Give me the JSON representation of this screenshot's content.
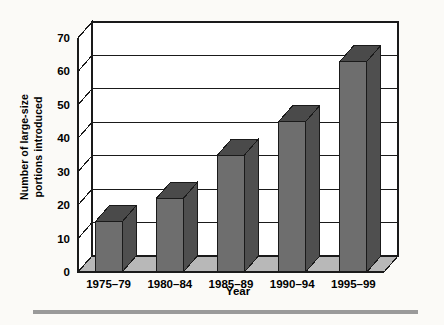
{
  "chart_data": {
    "type": "bar",
    "title": "",
    "xlabel": "Year",
    "ylabel_line1": "Number of large-size",
    "ylabel_line2": "portions introduced",
    "ylabel": "Number of large-size portions introduced",
    "categories": [
      "1975–79",
      "1980–84",
      "1985–89",
      "1990–94",
      "1995–99"
    ],
    "values": [
      15,
      22,
      35,
      45,
      63
    ],
    "ylim": [
      0,
      70
    ],
    "yticks": [
      0,
      10,
      20,
      30,
      40,
      50,
      60,
      70
    ],
    "ytick_labels": [
      "0",
      "10",
      "20",
      "30",
      "40",
      "50",
      "60",
      "70"
    ],
    "grid": true,
    "legend": "none",
    "style": "3d-column",
    "colors": {
      "bar_front": "#6e6e6e",
      "bar_top": "#4a4a4a",
      "bar_side": "#4f4f4f",
      "axis": "#1a1a1a",
      "grid": "#1a1a1a",
      "wall": "#ffffff",
      "floor": "#b0b0b0",
      "background": "#fbfaf7",
      "rule": "#9a9a9a"
    }
  },
  "figure": {
    "bottom_rule_label": "decorative-rule"
  }
}
